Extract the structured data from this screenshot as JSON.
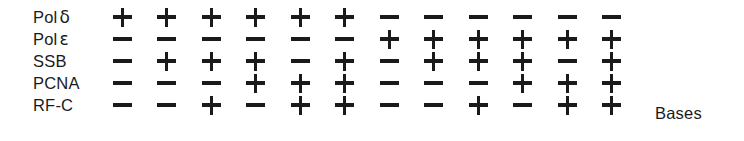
{
  "figure": {
    "matrix": {
      "symbols": {
        "present": "+",
        "absent": "−"
      },
      "rows": [
        {
          "label_text": "Pol",
          "label_greek": "δ",
          "name": "pol-delta",
          "values": [
            "+",
            "+",
            "+",
            "+",
            "+",
            "+",
            "-",
            "-",
            "-",
            "-",
            "-",
            "-"
          ]
        },
        {
          "label_text": "Pol",
          "label_greek": "ε",
          "name": "pol-epsilon",
          "values": [
            "-",
            "-",
            "-",
            "-",
            "-",
            "-",
            "+",
            "+",
            "+",
            "+",
            "+",
            "+"
          ]
        },
        {
          "label_text": "SSB",
          "label_greek": "",
          "name": "ssb",
          "values": [
            "-",
            "+",
            "+",
            "+",
            "-",
            "+",
            "-",
            "+",
            "+",
            "+",
            "-",
            "+"
          ]
        },
        {
          "label_text": "PCNA",
          "label_greek": "",
          "name": "pcna",
          "values": [
            "-",
            "-",
            "-",
            "+",
            "+",
            "+",
            "-",
            "-",
            "-",
            "+",
            "+",
            "+"
          ]
        },
        {
          "label_text": "RF-C",
          "label_greek": "",
          "name": "rf-c",
          "values": [
            "-",
            "-",
            "+",
            "-",
            "+",
            "+",
            "-",
            "-",
            "+",
            "-",
            "+",
            "+"
          ]
        }
      ],
      "column_count": 12
    },
    "annotation": {
      "label": "Bases"
    },
    "colors": {
      "ink": "#1a1a1a",
      "background": "#ffffff"
    }
  }
}
